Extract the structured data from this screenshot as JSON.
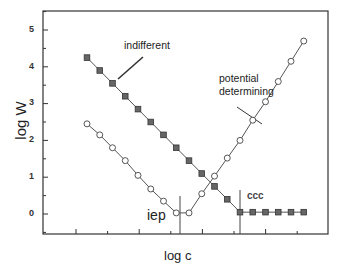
{
  "chart_data": {
    "type": "line",
    "title": "",
    "xlabel": "log c",
    "ylabel": "log W",
    "ylim": [
      -0.5,
      5.5
    ],
    "yticks": [
      0,
      1,
      2,
      3,
      4,
      5
    ],
    "xticks_labeled": false,
    "grid": false,
    "legend": "none (inline annotations)",
    "series": [
      {
        "name": "indifferent",
        "marker": "filled-square",
        "x": [
          1,
          2,
          3,
          4,
          5,
          6,
          7,
          8,
          9,
          10,
          11,
          12,
          13,
          14,
          15,
          16,
          17,
          18
        ],
        "values": [
          4.25,
          3.9,
          3.55,
          3.2,
          2.85,
          2.5,
          2.15,
          1.8,
          1.45,
          1.1,
          0.75,
          0.4,
          0.05,
          0.05,
          0.05,
          0.05,
          0.05,
          0.05
        ]
      },
      {
        "name": "potential determining",
        "marker": "open-circle",
        "x": [
          1,
          2,
          3,
          4,
          5,
          6,
          7,
          8,
          9,
          10,
          11,
          12,
          13,
          14,
          15,
          16,
          17,
          18
        ],
        "values": [
          2.45,
          2.15,
          1.8,
          1.45,
          1.05,
          0.68,
          0.35,
          0.03,
          0.03,
          0.55,
          1.03,
          1.52,
          2.0,
          2.55,
          3.05,
          3.6,
          4.15,
          4.7
        ]
      }
    ],
    "annotations": [
      {
        "text": "indifferent",
        "arrow_to_series": "indifferent"
      },
      {
        "text": "potential determining",
        "arrow_to_series": "potential determining"
      },
      {
        "text": "iep",
        "vertical_line_at_x": 8.2
      },
      {
        "text": "ccc",
        "vertical_line_at_x": 13
      }
    ]
  },
  "labels": {
    "ylabel": "log W",
    "xlabel": "log c",
    "indifferent": "indifferent",
    "potential_1": "potential",
    "potential_2": "determining",
    "iep": "iep",
    "ccc": "ccc",
    "y5": "5",
    "y4": "4",
    "y3": "3",
    "y2": "2",
    "y1": "1",
    "y0": "0"
  }
}
